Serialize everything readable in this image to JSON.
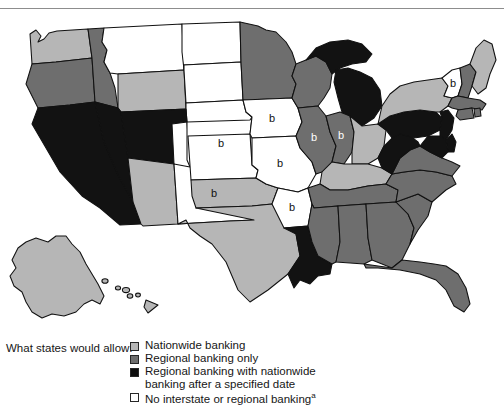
{
  "figure": {
    "kind": "choropleth-map",
    "region": "United States",
    "topic": "Interstate banking laws by state"
  },
  "legend": {
    "title": "What states would allow:",
    "items": [
      {
        "key": "nationwide",
        "label": "Nationwide banking",
        "label2": "",
        "color": "#b6b6b6"
      },
      {
        "key": "regional",
        "label": "Regional banking only",
        "label2": "",
        "color": "#6e6e6e"
      },
      {
        "key": "regional_then_nationwide",
        "label": "Regional banking with nationwide",
        "label2": "banking after a specified date",
        "color": "#0d0d0d"
      },
      {
        "key": "none",
        "label": "No interstate or regional banking",
        "label2": "",
        "footnote": "a",
        "color": "#ffffff"
      }
    ]
  },
  "map_data": {
    "type": "choropleth",
    "categories": [
      "nationwide",
      "regional",
      "regional_then_nationwide",
      "none"
    ],
    "marker_label": "b",
    "states": [
      {
        "code": "WA",
        "name": "Washington",
        "category": "nationwide",
        "marker": ""
      },
      {
        "code": "OR",
        "name": "Oregon",
        "category": "regional",
        "marker": ""
      },
      {
        "code": "ID",
        "name": "Idaho",
        "category": "regional",
        "marker": ""
      },
      {
        "code": "MT",
        "name": "Montana",
        "category": "none",
        "marker": ""
      },
      {
        "code": "WY",
        "name": "Wyoming",
        "category": "nationwide",
        "marker": ""
      },
      {
        "code": "ND",
        "name": "North Dakota",
        "category": "none",
        "marker": ""
      },
      {
        "code": "SD",
        "name": "South Dakota",
        "category": "none",
        "marker": ""
      },
      {
        "code": "NE",
        "name": "Nebraska",
        "category": "none",
        "marker": ""
      },
      {
        "code": "CA",
        "name": "California",
        "category": "regional_then_nationwide",
        "marker": ""
      },
      {
        "code": "NV",
        "name": "Nevada",
        "category": "regional_then_nationwide",
        "marker": ""
      },
      {
        "code": "UT",
        "name": "Utah",
        "category": "regional_then_nationwide",
        "marker": ""
      },
      {
        "code": "AZ",
        "name": "Arizona",
        "category": "nationwide",
        "marker": ""
      },
      {
        "code": "CO",
        "name": "Colorado",
        "category": "none",
        "marker": "b"
      },
      {
        "code": "NM",
        "name": "New Mexico",
        "category": "none",
        "marker": "b"
      },
      {
        "code": "TX",
        "name": "Texas",
        "category": "nationwide",
        "marker": ""
      },
      {
        "code": "OK",
        "name": "Oklahoma",
        "category": "nationwide",
        "marker": ""
      },
      {
        "code": "KS",
        "name": "Kansas",
        "category": "none",
        "marker": ""
      },
      {
        "code": "MN",
        "name": "Minnesota",
        "category": "regional",
        "marker": ""
      },
      {
        "code": "IA",
        "name": "Iowa",
        "category": "none",
        "marker": "b"
      },
      {
        "code": "MO",
        "name": "Missouri",
        "category": "none",
        "marker": "b"
      },
      {
        "code": "AR",
        "name": "Arkansas",
        "category": "none",
        "marker": "b"
      },
      {
        "code": "LA",
        "name": "Louisiana",
        "category": "regional_then_nationwide",
        "marker": ""
      },
      {
        "code": "WI",
        "name": "Wisconsin",
        "category": "regional",
        "marker": ""
      },
      {
        "code": "IL",
        "name": "Illinois",
        "category": "regional",
        "marker": "b"
      },
      {
        "code": "MI",
        "name": "Michigan",
        "category": "regional_then_nationwide",
        "marker": ""
      },
      {
        "code": "IN",
        "name": "Indiana",
        "category": "regional",
        "marker": "b"
      },
      {
        "code": "OH",
        "name": "Ohio",
        "category": "nationwide",
        "marker": ""
      },
      {
        "code": "KY",
        "name": "Kentucky",
        "category": "nationwide",
        "marker": ""
      },
      {
        "code": "TN",
        "name": "Tennessee",
        "category": "regional",
        "marker": ""
      },
      {
        "code": "MS",
        "name": "Mississippi",
        "category": "regional",
        "marker": ""
      },
      {
        "code": "AL",
        "name": "Alabama",
        "category": "regional",
        "marker": ""
      },
      {
        "code": "GA",
        "name": "Georgia",
        "category": "regional",
        "marker": ""
      },
      {
        "code": "FL",
        "name": "Florida",
        "category": "regional",
        "marker": ""
      },
      {
        "code": "SC",
        "name": "South Carolina",
        "category": "regional",
        "marker": ""
      },
      {
        "code": "NC",
        "name": "North Carolina",
        "category": "regional",
        "marker": ""
      },
      {
        "code": "VA",
        "name": "Virginia",
        "category": "regional",
        "marker": ""
      },
      {
        "code": "WV",
        "name": "West Virginia",
        "category": "regional_then_nationwide",
        "marker": ""
      },
      {
        "code": "PA",
        "name": "Pennsylvania",
        "category": "regional_then_nationwide",
        "marker": ""
      },
      {
        "code": "NY",
        "name": "New York",
        "category": "nationwide",
        "marker": ""
      },
      {
        "code": "VT",
        "name": "Vermont",
        "category": "none",
        "marker": "b"
      },
      {
        "code": "NH",
        "name": "New Hampshire",
        "category": "regional",
        "marker": ""
      },
      {
        "code": "ME",
        "name": "Maine",
        "category": "nationwide",
        "marker": ""
      },
      {
        "code": "MA",
        "name": "Massachusetts",
        "category": "regional",
        "marker": ""
      },
      {
        "code": "RI",
        "name": "Rhode Island",
        "category": "regional",
        "marker": ""
      },
      {
        "code": "CT",
        "name": "Connecticut",
        "category": "regional",
        "marker": ""
      },
      {
        "code": "NJ",
        "name": "New Jersey",
        "category": "regional_then_nationwide",
        "marker": ""
      },
      {
        "code": "DE",
        "name": "Delaware",
        "category": "regional_then_nationwide",
        "marker": ""
      },
      {
        "code": "MD",
        "name": "Maryland",
        "category": "regional_then_nationwide",
        "marker": ""
      },
      {
        "code": "AK",
        "name": "Alaska",
        "category": "nationwide",
        "marker": ""
      },
      {
        "code": "HI",
        "name": "Hawaii",
        "category": "nationwide",
        "marker": ""
      }
    ]
  }
}
